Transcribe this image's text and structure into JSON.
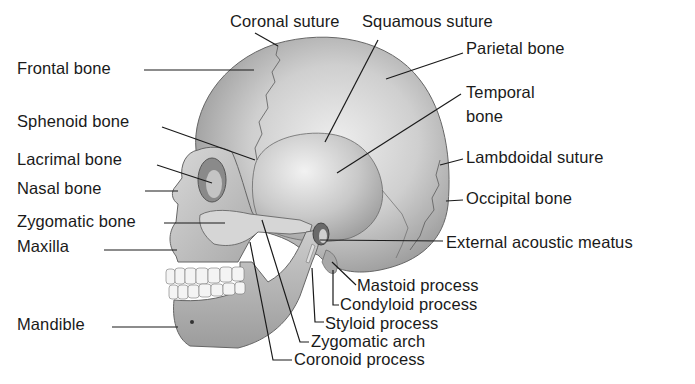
{
  "diagram": {
    "colors": {
      "background": "#ffffff",
      "bone_light": "#e4e4e4",
      "bone_mid": "#b8b8b8",
      "bone_dark": "#7a7a7a",
      "outline": "#555555",
      "leader": "#1a1a1a",
      "text": "#1a1a1a"
    },
    "labels": [
      {
        "id": "coronal-suture",
        "text": "Coronal suture",
        "x": 230,
        "y": 12,
        "line": [
          [
            255,
            33
          ],
          [
            278,
            46
          ]
        ]
      },
      {
        "id": "squamous-suture",
        "text": "Squamous suture",
        "x": 362,
        "y": 12,
        "line": [
          [
            378,
            40
          ],
          [
            325,
            142
          ]
        ]
      },
      {
        "id": "parietal-bone",
        "text": "Parietal bone",
        "x": 466,
        "y": 39,
        "line": [
          [
            463,
            53
          ],
          [
            386,
            79
          ]
        ]
      },
      {
        "id": "temporal-bone",
        "text": "Temporal",
        "x": 466,
        "y": 83,
        "line": [
          [
            461,
            94
          ],
          [
            337,
            173
          ]
        ]
      },
      {
        "id": "temporal-bone-2",
        "text": "bone",
        "x": 466,
        "y": 107,
        "line": null
      },
      {
        "id": "lambdoidal-suture",
        "text": "Lambdoidal suture",
        "x": 466,
        "y": 148,
        "line": [
          [
            463,
            159
          ],
          [
            440,
            165
          ]
        ]
      },
      {
        "id": "occipital-bone",
        "text": "Occipital bone",
        "x": 466,
        "y": 189,
        "line": [
          [
            463,
            200
          ],
          [
            446,
            201
          ]
        ]
      },
      {
        "id": "external-acoustic-meatus",
        "text": "External acoustic meatus",
        "x": 446,
        "y": 233,
        "line": [
          [
            443,
            241
          ],
          [
            320,
            240
          ]
        ]
      },
      {
        "id": "mastoid-process",
        "text": "Mastoid process",
        "x": 357,
        "y": 276,
        "line": [
          [
            356,
            285
          ],
          [
            332,
            262
          ]
        ]
      },
      {
        "id": "condyloid-process",
        "text": "Condyloid process",
        "x": 340,
        "y": 295,
        "line": [
          [
            339,
            305
          ],
          [
            333,
            305
          ],
          [
            333,
            270
          ]
        ]
      },
      {
        "id": "styloid-process",
        "text": "Styloid process",
        "x": 325,
        "y": 314,
        "line": [
          [
            324,
            322
          ],
          [
            315,
            322
          ],
          [
            312,
            268
          ]
        ]
      },
      {
        "id": "zygomatic-arch",
        "text": "Zygomatic arch",
        "x": 311,
        "y": 332,
        "line": [
          [
            309,
            342
          ],
          [
            300,
            342
          ],
          [
            262,
            220
          ]
        ]
      },
      {
        "id": "coronoid-process",
        "text": "Coronoid process",
        "x": 294,
        "y": 350,
        "line": [
          [
            292,
            360
          ],
          [
            273,
            360
          ],
          [
            250,
            242
          ]
        ]
      },
      {
        "id": "frontal-bone",
        "text": "Frontal bone",
        "x": 17,
        "y": 59,
        "line": [
          [
            144,
            70
          ],
          [
            254,
            70
          ]
        ]
      },
      {
        "id": "sphenoid-bone",
        "text": "Sphenoid bone",
        "x": 17,
        "y": 112,
        "line": [
          [
            162,
            127
          ],
          [
            255,
            160
          ]
        ]
      },
      {
        "id": "lacrimal-bone",
        "text": "Lacrimal bone",
        "x": 17,
        "y": 150,
        "line": [
          [
            157,
            165
          ],
          [
            212,
            183
          ]
        ]
      },
      {
        "id": "nasal-bone",
        "text": "Nasal bone",
        "x": 17,
        "y": 179,
        "line": [
          [
            145,
            191
          ],
          [
            178,
            191
          ]
        ]
      },
      {
        "id": "zygomatic-bone",
        "text": "Zygomatic bone",
        "x": 17,
        "y": 212,
        "line": [
          [
            164,
            223
          ],
          [
            225,
            223
          ]
        ]
      },
      {
        "id": "maxilla",
        "text": "Maxilla",
        "x": 17,
        "y": 237,
        "line": [
          [
            104,
            250
          ],
          [
            177,
            250
          ]
        ]
      },
      {
        "id": "mandible",
        "text": "Mandible",
        "x": 17,
        "y": 315,
        "line": [
          [
            112,
            327
          ],
          [
            178,
            327
          ]
        ]
      }
    ]
  }
}
